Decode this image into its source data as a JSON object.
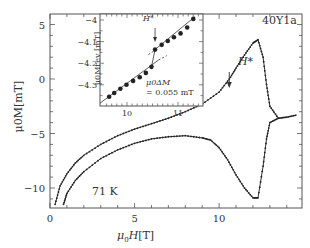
{
  "chart_data": [
    {
      "type": "line",
      "title": "",
      "sample_label": "40Y1a",
      "temperature_label": "71 K",
      "xlabel": "μ0H [T]",
      "ylabel": "μ0M [mT]",
      "xlim": [
        0,
        14.9
      ],
      "ylim": [
        -11.8,
        6.0
      ],
      "xticks": [
        0,
        5,
        10
      ],
      "yticks": [
        5,
        0,
        -5,
        -10
      ],
      "grid": false,
      "legend": "none",
      "annotations": [
        {
          "text": "H*",
          "x": 10.6,
          "y": 1.1,
          "arrow": true
        }
      ],
      "series": [
        {
          "name": "upper branch (increasing M)",
          "x": [
            0.3,
            0.6,
            1.0,
            1.5,
            2.0,
            3.0,
            4.0,
            5.0,
            6.0,
            7.0,
            8.0,
            9.0,
            10.0,
            10.6,
            11.0,
            11.5,
            12.0,
            12.3,
            12.6,
            12.8,
            13.0,
            13.5,
            14.0,
            14.6
          ],
          "values": [
            -11.5,
            -9.8,
            -8.7,
            -7.7,
            -7.0,
            -6.0,
            -5.2,
            -4.6,
            -4.1,
            -3.6,
            -3.0,
            -2.3,
            -1.2,
            0.0,
            1.0,
            2.2,
            3.3,
            3.6,
            2.0,
            -0.5,
            -2.5,
            -3.6,
            -3.5,
            -3.3
          ]
        },
        {
          "name": "lower branch (decreasing M)",
          "x": [
            0.8,
            1.0,
            1.5,
            2.0,
            3.0,
            4.0,
            5.0,
            6.0,
            7.0,
            8.0,
            9.0,
            9.5,
            10.0,
            10.5,
            11.0,
            11.5,
            12.0,
            12.3,
            12.6,
            12.8,
            13.0,
            13.5
          ],
          "values": [
            -11.5,
            -10.5,
            -9.3,
            -8.5,
            -7.3,
            -6.5,
            -5.9,
            -5.5,
            -5.3,
            -5.2,
            -5.4,
            -5.6,
            -6.3,
            -7.4,
            -8.8,
            -10.0,
            -10.9,
            -10.9,
            -8.0,
            -5.5,
            -4.0,
            -3.6
          ]
        }
      ]
    },
    {
      "type": "scatter",
      "title": "inset",
      "xlabel": "",
      "ylabel": "μ0Mrev [mT]",
      "xlim": [
        9.55,
        11.5
      ],
      "ylim": [
        -4.39,
        -3.95
      ],
      "xticks": [
        10,
        11
      ],
      "yticks": [
        -4,
        -4.1,
        -4.2,
        -4.3
      ],
      "annotations": [
        {
          "text": "H*",
          "x": 10.52,
          "y": -4.14,
          "arrow": true
        },
        {
          "text": "μ0ΔM",
          "x": 10.6,
          "y": -4.3
        },
        {
          "text": "= 0.055 mT",
          "x": 10.6,
          "y": -4.34
        }
      ],
      "series": [
        {
          "name": "Mrev",
          "x": [
            9.65,
            9.75,
            9.87,
            9.99,
            10.12,
            10.25,
            10.37,
            10.48,
            10.55,
            10.68,
            10.8,
            10.92,
            11.05,
            11.18,
            11.3
          ],
          "values": [
            -4.355,
            -4.338,
            -4.318,
            -4.3,
            -4.282,
            -4.265,
            -4.245,
            -4.217,
            -4.137,
            -4.115,
            -4.097,
            -4.08,
            -4.062,
            -4.035,
            -3.995
          ]
        }
      ]
    }
  ],
  "labels": {
    "sample": "40Y1a",
    "temperature": "71 K",
    "xaxis_mu": "μ",
    "xaxis_sub": "0",
    "xaxis_var": "H",
    "xaxis_unit": "[T]",
    "yaxis_full": "μ0M[mT]",
    "hstar": "H*",
    "inset_ylabel": "μ0Mrev [mT]",
    "inset_dm1": "μ0ΔM",
    "inset_dm2": "= 0.055 mT"
  }
}
